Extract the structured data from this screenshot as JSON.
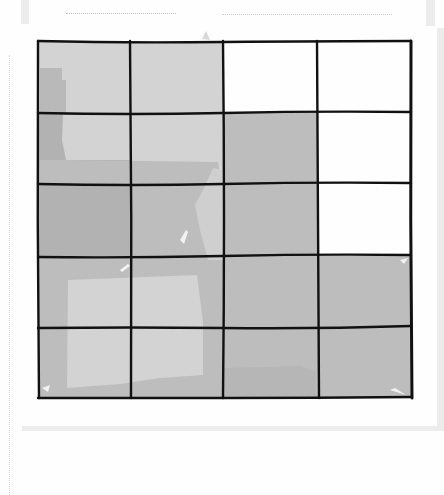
{
  "figure": {
    "grid": {
      "columns": 4,
      "rows": 5,
      "col_lines_x": [
        38,
        130,
        223,
        317,
        411
      ],
      "row_lines_y": [
        41,
        113,
        184,
        256,
        327,
        398
      ],
      "line_color": "#111111"
    },
    "palette": {
      "white": "#fefefe",
      "light": "#d3d3d3",
      "medium": "#bdbdbd",
      "dark": "#b2b2b2"
    },
    "cells": [
      [
        "light",
        "light",
        "white",
        "white"
      ],
      [
        "dark",
        "light",
        "medium",
        "white"
      ],
      [
        "dark",
        "medium",
        "medium",
        "white"
      ],
      [
        "medium",
        "medium",
        "medium",
        "medium"
      ],
      [
        "medium",
        "medium",
        "medium",
        "medium"
      ]
    ]
  }
}
